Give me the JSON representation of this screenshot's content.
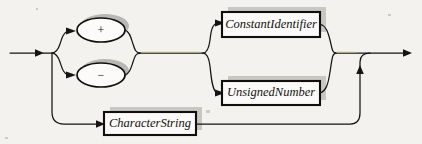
{
  "diagram": {
    "kind": "railroad-syntax-diagram",
    "title": "Constant",
    "background_color": "#f3f2ef",
    "line_color": "#141414",
    "tint_color": "#b9b47e",
    "shadow_color": "#c9c7c2",
    "box_fill": "#fbfaf8",
    "entry": {
      "name": "entry-arrow",
      "x_start": 10,
      "x_end": 44,
      "y": 53
    },
    "exit": {
      "name": "exit-arrow",
      "x_start": 352,
      "x_end": 412,
      "y": 53
    },
    "sign_group": {
      "label": "sign-alternatives",
      "options": [
        {
          "id": "plus",
          "label": "+",
          "cx": 101,
          "cy": 30,
          "rx": 24,
          "ry": 12
        },
        {
          "id": "minus",
          "label": "−",
          "cx": 101,
          "cy": 75,
          "rx": 24,
          "ry": 12
        }
      ]
    },
    "terminals": [
      {
        "id": "constant-identifier",
        "label": "ConstantIdentifier",
        "x": 222,
        "y": 12,
        "width": 98,
        "height": 25
      },
      {
        "id": "unsigned-number",
        "label": "UnsignedNumber",
        "x": 222,
        "y": 81,
        "width": 98,
        "height": 24
      },
      {
        "id": "character-string",
        "label": "CharacterString",
        "x": 104,
        "y": 112,
        "width": 92,
        "height": 23
      }
    ],
    "branch_points": [
      {
        "id": "sign-split",
        "x": 52,
        "y": 53
      },
      {
        "id": "value-split",
        "x": 203,
        "y": 53
      },
      {
        "id": "value-merge",
        "x": 335,
        "y": 53
      },
      {
        "id": "string-merge",
        "x": 360,
        "y": 124
      }
    ]
  }
}
